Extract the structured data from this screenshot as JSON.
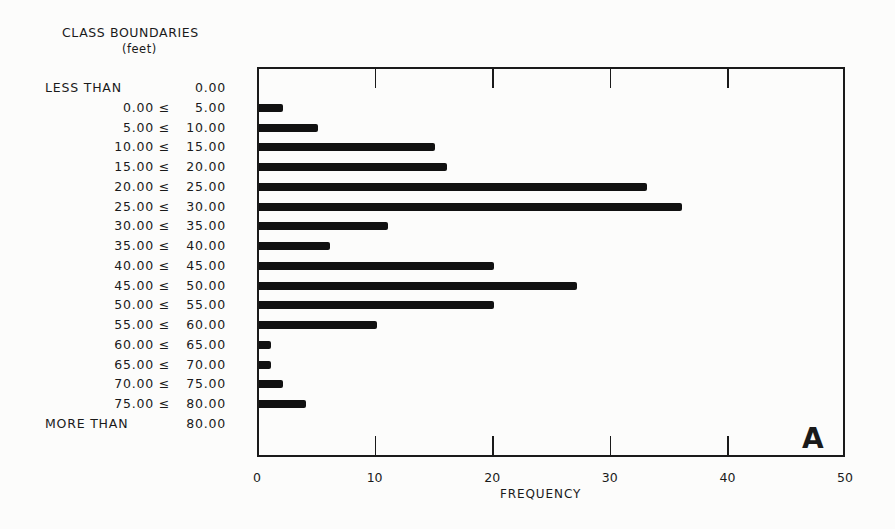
{
  "chart_data": {
    "type": "bar",
    "orientation": "horizontal",
    "title": "CLASS BOUNDARIES",
    "subtitle": "(feet)",
    "xlabel": "FREQUENCY",
    "ylabel": "CLASS BOUNDARIES (feet)",
    "xlim": [
      0,
      50
    ],
    "x_ticks": [
      "0",
      "10",
      "20",
      "30",
      "40",
      "50"
    ],
    "panel_label": "A",
    "grid": false,
    "categories": [
      {
        "lead": "LESS THAN",
        "lo": "",
        "hi": "0.00",
        "value": 0
      },
      {
        "lead": "",
        "lo": "0.00 ≤",
        "hi": "5.00",
        "value": 2
      },
      {
        "lead": "",
        "lo": "5.00 ≤",
        "hi": "10.00",
        "value": 5
      },
      {
        "lead": "",
        "lo": "10.00 ≤",
        "hi": "15.00",
        "value": 15
      },
      {
        "lead": "",
        "lo": "15.00 ≤",
        "hi": "20.00",
        "value": 16
      },
      {
        "lead": "",
        "lo": "20.00 ≤",
        "hi": "25.00",
        "value": 33
      },
      {
        "lead": "",
        "lo": "25.00 ≤",
        "hi": "30.00",
        "value": 36
      },
      {
        "lead": "",
        "lo": "30.00 ≤",
        "hi": "35.00",
        "value": 11
      },
      {
        "lead": "",
        "lo": "35.00 ≤",
        "hi": "40.00",
        "value": 6
      },
      {
        "lead": "",
        "lo": "40.00 ≤",
        "hi": "45.00",
        "value": 20
      },
      {
        "lead": "",
        "lo": "45.00 ≤",
        "hi": "50.00",
        "value": 27
      },
      {
        "lead": "",
        "lo": "50.00 ≤",
        "hi": "55.00",
        "value": 20
      },
      {
        "lead": "",
        "lo": "55.00 ≤",
        "hi": "60.00",
        "value": 10
      },
      {
        "lead": "",
        "lo": "60.00 ≤",
        "hi": "65.00",
        "value": 1
      },
      {
        "lead": "",
        "lo": "65.00 ≤",
        "hi": "70.00",
        "value": 1
      },
      {
        "lead": "",
        "lo": "70.00 ≤",
        "hi": "75.00",
        "value": 2
      },
      {
        "lead": "",
        "lo": "75.00 ≤",
        "hi": "80.00",
        "value": 4
      },
      {
        "lead": "MORE THAN",
        "lo": "",
        "hi": "80.00",
        "value": 0
      }
    ],
    "values": [
      0,
      2,
      5,
      15,
      16,
      33,
      36,
      11,
      6,
      20,
      27,
      20,
      10,
      1,
      1,
      2,
      4,
      0
    ]
  }
}
